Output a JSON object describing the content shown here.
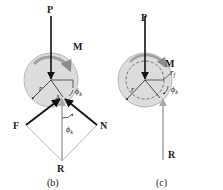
{
  "figure_b": {
    "caption": "(b)",
    "labels": {
      "P": "P",
      "M": "M",
      "r": "r",
      "A": "A",
      "phi_k": "ϕ",
      "phi_k_sub": "k",
      "phi_k2": "ϕ",
      "phi_k2_sub": "k",
      "F": "F",
      "N": "N",
      "R": "R"
    }
  },
  "figure_c": {
    "caption": "(c)",
    "labels": {
      "P": "P",
      "M": "M",
      "r": "r",
      "r_f": "r",
      "r_f_sub": "f",
      "phi_k": "ϕ",
      "phi_k_sub": "k",
      "R": "R"
    }
  },
  "colors": {
    "disk_fill": "#d9d9d9",
    "disk_stroke": "#b0b0b0",
    "arrow_dark": "#111111",
    "arrow_gray": "#a8a8a8",
    "moment_arrow": "#9a9a9a"
  }
}
